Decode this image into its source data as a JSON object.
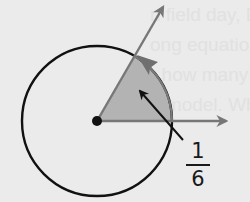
{
  "figure": {
    "label": {
      "numerator": "1",
      "denominator": "6"
    },
    "sector": {
      "fraction_of_circle": "1/6",
      "angle_degrees": 60,
      "fill_color": "#b3b3b3"
    },
    "colors": {
      "background": "#ebebeb",
      "circle_stroke": "#111111",
      "ray_color": "#777777",
      "pointer_color": "#111111"
    },
    "bleed_through_text": [
      "n field day, Danny",
      "ong equations C",
      "r how many",
      "e model. Wh"
    ]
  }
}
